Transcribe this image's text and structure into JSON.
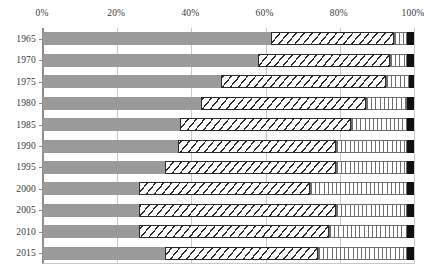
{
  "chart_data": {
    "type": "bar",
    "orientation": "horizontal",
    "stacked": true,
    "normalized_percent": true,
    "title": "",
    "subtitle": "",
    "xlabel": "",
    "ylabel": "",
    "xlim": [
      0,
      100
    ],
    "grid": true,
    "legend_position": "none",
    "x_ticks": [
      {
        "value": 0,
        "label": "0%"
      },
      {
        "value": 20,
        "label": "20%"
      },
      {
        "value": 40,
        "label": "40%"
      },
      {
        "value": 60,
        "label": "60%"
      },
      {
        "value": 80,
        "label": "80%"
      },
      {
        "value": 100,
        "label": "100%"
      }
    ],
    "categories": [
      "1965",
      "1970",
      "1975",
      "1980",
      "1985",
      "1990",
      "1995",
      "2000",
      "2005",
      "2010",
      "2015"
    ],
    "series": [
      {
        "name": "segment-1",
        "fill": "solid-gray",
        "color": "#9a9a9a",
        "values": [
          61.5,
          58.0,
          48.0,
          42.5,
          37.0,
          36.5,
          33.0,
          26.0,
          26.0,
          26.0,
          33.0
        ]
      },
      {
        "name": "segment-2",
        "fill": "diagonal-hatch",
        "color": "#2b2b2b",
        "values": [
          33.0,
          35.5,
          44.5,
          44.5,
          46.0,
          42.5,
          46.0,
          46.0,
          53.0,
          51.0,
          41.0
        ]
      },
      {
        "name": "segment-3",
        "fill": "vertical-hatch",
        "color": "#6e6e6e",
        "values": [
          3.7,
          4.7,
          6.1,
          11.2,
          15.2,
          19.2,
          19.2,
          26.2,
          19.2,
          21.2,
          24.2
        ]
      },
      {
        "name": "segment-4",
        "fill": "solid-black",
        "color": "#111111",
        "values": [
          1.8,
          1.8,
          1.4,
          1.8,
          1.8,
          1.8,
          1.8,
          1.8,
          1.8,
          1.8,
          1.8
        ]
      }
    ],
    "cumulative_boundaries": [
      {
        "category": "1965",
        "b1": 61.5,
        "b2": 94.5,
        "b3": 98.2,
        "b4": 100.0
      },
      {
        "category": "1970",
        "b1": 58.0,
        "b2": 93.5,
        "b3": 98.2,
        "b4": 100.0
      },
      {
        "category": "1975",
        "b1": 48.0,
        "b2": 92.5,
        "b3": 98.6,
        "b4": 100.0
      },
      {
        "category": "1980",
        "b1": 42.5,
        "b2": 87.0,
        "b3": 98.2,
        "b4": 100.0
      },
      {
        "category": "1985",
        "b1": 37.0,
        "b2": 83.0,
        "b3": 98.2,
        "b4": 100.0
      },
      {
        "category": "1990",
        "b1": 36.5,
        "b2": 79.0,
        "b3": 98.2,
        "b4": 100.0
      },
      {
        "category": "1995",
        "b1": 33.0,
        "b2": 79.0,
        "b3": 98.2,
        "b4": 100.0
      },
      {
        "category": "2000",
        "b1": 26.0,
        "b2": 72.0,
        "b3": 98.2,
        "b4": 100.0
      },
      {
        "category": "2005",
        "b1": 26.0,
        "b2": 79.0,
        "b3": 98.2,
        "b4": 100.0
      },
      {
        "category": "2010",
        "b1": 26.0,
        "b2": 77.0,
        "b3": 98.2,
        "b4": 100.0
      },
      {
        "category": "2015",
        "b1": 33.0,
        "b2": 74.0,
        "b3": 98.2,
        "b4": 100.0
      }
    ]
  },
  "colors": {
    "segment_gray": "#9a9a9a",
    "segment_hatch": "#2b2b2b",
    "segment_vert": "#6e6e6e",
    "segment_black": "#111111",
    "gridline": "#c8c8c8",
    "axis": "#8c8c8c",
    "text": "#3a3a3a",
    "background": "#ffffff"
  }
}
